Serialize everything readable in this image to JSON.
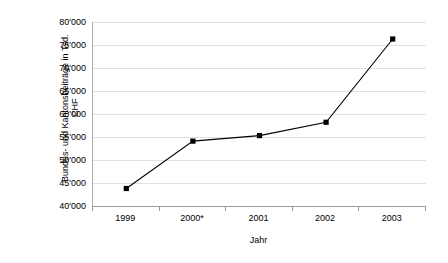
{
  "chart_data": {
    "type": "line",
    "title": "",
    "xlabel": "Jahr",
    "ylabel": "Bundes- und Kantonsbeiträge in Tsd. CHF",
    "ylabel_lines": [
      "Bundes- und Kantonsbeiträge in Tsd.",
      "CHF"
    ],
    "categories": [
      "1999",
      "2000*",
      "2001",
      "2002",
      "2003"
    ],
    "values": [
      43800,
      54100,
      55300,
      58200,
      76300
    ],
    "series": [
      {
        "name": "Bundes- und Kantonsbeiträge",
        "values": [
          43800,
          54100,
          55300,
          58200,
          76300
        ]
      }
    ],
    "ylim": [
      40000,
      80000
    ],
    "ytick_values": [
      40000,
      45000,
      50000,
      55000,
      60000,
      65000,
      70000,
      75000,
      80000
    ],
    "ytick_labels": [
      "40'000",
      "45'000",
      "50'000",
      "55'000",
      "60'000",
      "65'000",
      "70'000",
      "75'000",
      "80'000"
    ],
    "grid": true,
    "legend": "none",
    "marker": "square",
    "marker_color": "#000000",
    "line_color": "#000000",
    "grid_color": "#e2e2e2",
    "axis_color": "#9a9a9a",
    "background_color": "#ffffff"
  }
}
